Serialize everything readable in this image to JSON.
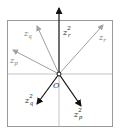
{
  "diagram": {
    "origin_label": "O",
    "colors": {
      "frame": "#9a9a9a",
      "axis": "#b0b0b0",
      "gray_vector": "#a0a0a0",
      "dark_vector": "#111111",
      "label_gray": "#777777",
      "label_dark": "#222222"
    },
    "vectors": [
      {
        "name": "z_p",
        "base": "z",
        "sub": "p",
        "sup": "",
        "style": "gray"
      },
      {
        "name": "z_q",
        "base": "z",
        "sub": "q",
        "sup": "",
        "style": "gray"
      },
      {
        "name": "z_r",
        "base": "z",
        "sub": "r",
        "sup": "",
        "style": "gray"
      },
      {
        "name": "z_r^2",
        "base": "z",
        "sub": "r",
        "sup": "2",
        "style": "dark"
      },
      {
        "name": "z_q^2",
        "base": "z",
        "sub": "q",
        "sup": "2",
        "style": "dark"
      },
      {
        "name": "z_p^2",
        "base": "z",
        "sub": "p",
        "sup": "2",
        "style": "dark"
      }
    ]
  }
}
